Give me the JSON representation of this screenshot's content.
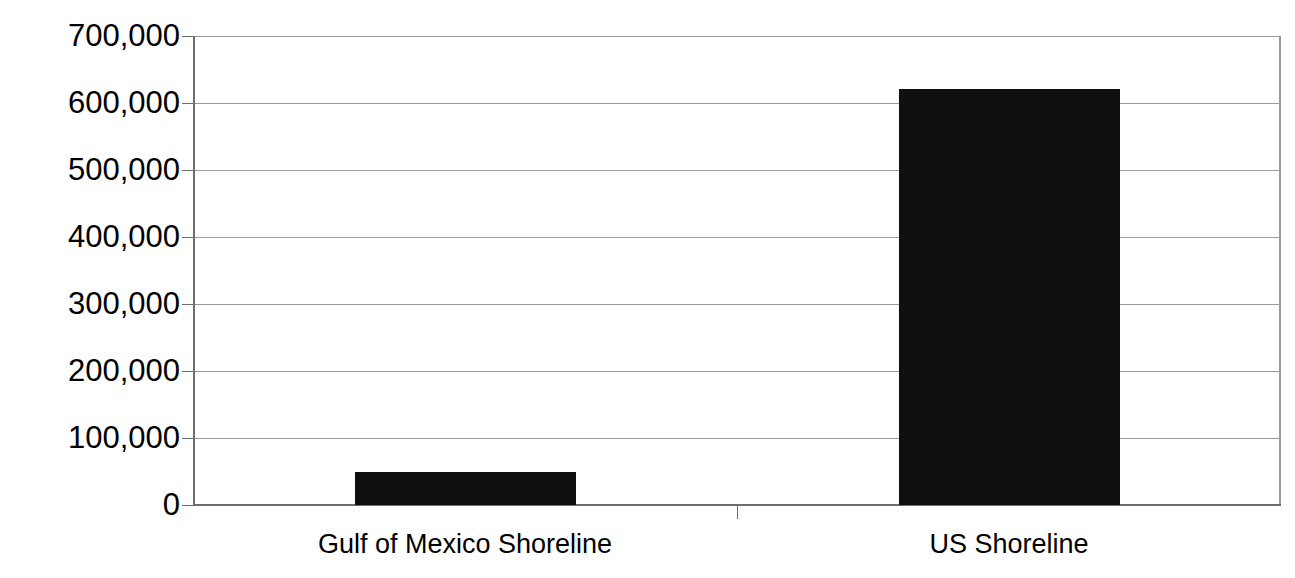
{
  "chart_data": {
    "type": "bar",
    "title": "",
    "xlabel": "",
    "ylabel": "Square Miles",
    "categories": [
      "Gulf of Mexico Shoreline",
      "US Shoreline"
    ],
    "values": [
      49000,
      621000
    ],
    "ylim": [
      0,
      700000
    ],
    "ytick_values": [
      0,
      100000,
      200000,
      300000,
      400000,
      500000,
      600000,
      700000
    ],
    "ytick_labels": [
      "0",
      "100,000",
      "200,000",
      "300,000",
      "400,000",
      "500,000",
      "600,000",
      "700,000"
    ],
    "grid": true,
    "legend": false,
    "legend_position": "none",
    "bar_color": "#101010",
    "gridline_color": "#9a9a9a",
    "axis_color": "#6e6e6e",
    "background_color": "#ffffff",
    "text_color": "#000000"
  }
}
